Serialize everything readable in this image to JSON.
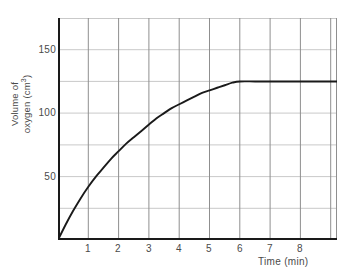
{
  "chart_data": {
    "type": "line",
    "title": "",
    "xlabel": "Time (min)",
    "ylabel_line1": "Volume of",
    "ylabel_line2": "oxygen (cm",
    "ylabel_sup": "3",
    "ylabel_line2_end": ")",
    "xlim": [
      0,
      9.2
    ],
    "ylim": [
      0,
      175
    ],
    "x_ticks": [
      1,
      2,
      3,
      4,
      5,
      6,
      7,
      8
    ],
    "x_tick_labels": [
      "1",
      "2",
      "3",
      "4",
      "5",
      "6",
      "7",
      "8"
    ],
    "y_ticks": [
      50,
      100,
      150
    ],
    "y_tick_labels": [
      "50",
      "100",
      "150"
    ],
    "y_gridlines": [
      25,
      50,
      75,
      100,
      125,
      150,
      175
    ],
    "x_gridlines": [
      1,
      2,
      3,
      4,
      5,
      6,
      7,
      8,
      9
    ],
    "grid": true,
    "legend": "none",
    "series": [
      {
        "name": "Volume of oxygen",
        "x": [
          0,
          0.25,
          0.5,
          0.75,
          1,
          1.25,
          1.5,
          1.75,
          2,
          2.25,
          2.5,
          2.75,
          3,
          3.25,
          3.5,
          3.75,
          4,
          4.25,
          4.5,
          4.75,
          5,
          5.25,
          5.5,
          5.75,
          6,
          6.5,
          7,
          7.5,
          8,
          8.5,
          9,
          9.2
        ],
        "values": [
          0,
          12,
          23,
          33,
          42,
          50,
          57,
          64,
          70,
          76,
          81,
          86,
          91,
          96,
          100,
          104,
          107,
          110,
          113,
          116,
          118,
          120,
          122,
          124,
          125,
          125,
          125,
          125,
          125,
          125,
          125,
          125
        ]
      }
    ],
    "plateau_value": 125,
    "plateau_start_time": 6,
    "colors": {
      "curve": "#1a1a1a",
      "axis": "#1a1a1a",
      "grid_major": "#8c8c8c",
      "grid_minor": "#c8c8c8",
      "text": "#4a4a4a",
      "background": "#ffffff"
    }
  }
}
